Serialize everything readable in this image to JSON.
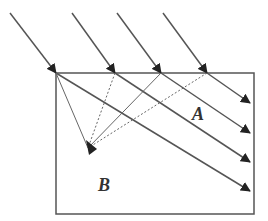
{
  "diagram": {
    "type": "ray-optics",
    "colors": {
      "line": "#555555",
      "arrow": "#222222",
      "box": "#555555",
      "background": "#ffffff"
    },
    "labels": {
      "region_a": "A",
      "region_b": "B"
    },
    "box": {
      "x": 56,
      "y": 73,
      "width": 198,
      "height": 141
    },
    "incident_rays": [
      {
        "x1": 10,
        "y1": 13,
        "x2": 56,
        "y2": 73
      },
      {
        "x1": 72,
        "y1": 13,
        "x2": 115,
        "y2": 73
      },
      {
        "x1": 117,
        "y1": 13,
        "x2": 161,
        "y2": 73
      },
      {
        "x1": 163,
        "y1": 13,
        "x2": 207,
        "y2": 73
      }
    ],
    "transmitted_rays": [
      {
        "x1": 207,
        "y1": 73,
        "x2": 250,
        "y2": 103
      },
      {
        "x1": 161,
        "y1": 73,
        "x2": 250,
        "y2": 133
      },
      {
        "x1": 115,
        "y1": 73,
        "x2": 250,
        "y2": 162
      },
      {
        "x1": 56,
        "y1": 73,
        "x2": 250,
        "y2": 191
      }
    ],
    "focal_point": {
      "x": 88,
      "y": 148
    },
    "converging_lines": [
      {
        "x1": 56,
        "y1": 73,
        "style": "solid"
      },
      {
        "x1": 115,
        "y1": 73,
        "style": "dotted"
      },
      {
        "x1": 161,
        "y1": 73,
        "style": "solid"
      },
      {
        "x1": 207,
        "y1": 73,
        "style": "dotted"
      }
    ]
  }
}
